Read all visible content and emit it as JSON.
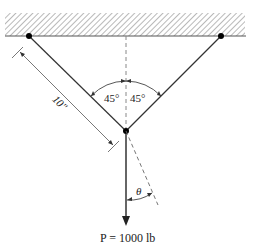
{
  "diagram": {
    "ceiling": {
      "hatch": true
    },
    "support_left": {
      "x": 29,
      "y": 36
    },
    "support_right": {
      "x": 221,
      "y": 36
    },
    "junction": {
      "x": 126,
      "y": 131
    },
    "angle_left_label": "45°",
    "angle_right_label": "45°",
    "length_label": "10\"",
    "theta_label": "θ",
    "load_label": "P = 1000 lb",
    "colors": {
      "line": "#333333",
      "hatch": "#999999",
      "dashed": "#888888"
    }
  }
}
